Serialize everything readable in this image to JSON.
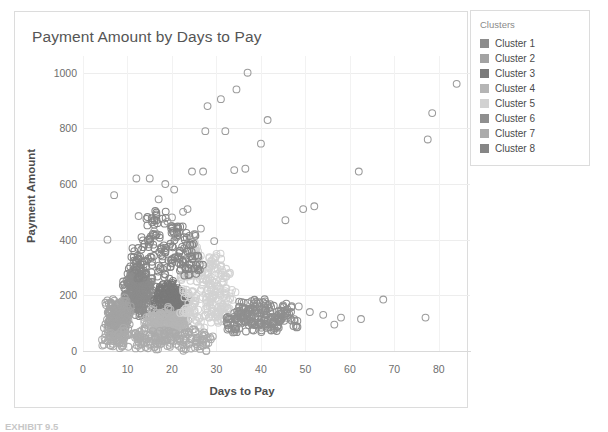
{
  "chart_card": {
    "title": "Payment Amount by Days to Pay"
  },
  "legend": {
    "title": "Clusters",
    "items": [
      {
        "label": "Cluster 1",
        "color": "#8c8c8c"
      },
      {
        "label": "Cluster 2",
        "color": "#a3a3a3"
      },
      {
        "label": "Cluster 3",
        "color": "#7a7a7a"
      },
      {
        "label": "Cluster 4",
        "color": "#b5b5b5"
      },
      {
        "label": "Cluster 5",
        "color": "#d2d2d2"
      },
      {
        "label": "Cluster 6",
        "color": "#8f8f8f"
      },
      {
        "label": "Cluster 7",
        "color": "#ababab"
      },
      {
        "label": "Cluster 8",
        "color": "#868686"
      }
    ]
  },
  "footer": {
    "caption": "EXHIBIT 9.5"
  },
  "chart_data": {
    "type": "scatter",
    "title": "Payment Amount by Days to Pay",
    "xlabel": "Days to Pay",
    "ylabel": "Payment Amount",
    "xlim": [
      0,
      87
    ],
    "ylim": [
      0,
      1060
    ],
    "xticks": [
      0,
      10,
      20,
      30,
      40,
      50,
      60,
      70,
      80
    ],
    "yticks": [
      0,
      200,
      400,
      600,
      800,
      1000
    ],
    "grid": true,
    "legend_position": "right-outside",
    "marker": "open-circle",
    "marker_radius": 3.4,
    "series": [
      {
        "name": "Cluster 1",
        "color": "#8c8c8c",
        "points": [
          [
            9.8,
            148
          ],
          [
            10.6,
            162
          ],
          [
            11.4,
            175
          ],
          [
            12.1,
            190
          ],
          [
            12.9,
            205
          ],
          [
            13.6,
            218
          ],
          [
            14.3,
            231
          ],
          [
            11.0,
            202
          ],
          [
            12.4,
            166
          ],
          [
            13.1,
            245
          ],
          [
            10.2,
            228
          ],
          [
            14.9,
            198
          ],
          [
            11.8,
            255
          ],
          [
            12.7,
            140
          ],
          [
            13.9,
            152
          ],
          [
            10.9,
            270
          ],
          [
            14.1,
            262
          ],
          [
            12.2,
            282
          ],
          [
            11.3,
            238
          ],
          [
            13.4,
            210
          ],
          [
            9.4,
            180
          ],
          [
            15.2,
            240
          ],
          [
            14.6,
            172
          ],
          [
            10.4,
            250
          ],
          [
            12.8,
            225
          ],
          [
            11.6,
            195
          ],
          [
            13.2,
            186
          ],
          [
            9.9,
            215
          ],
          [
            14.4,
            220
          ],
          [
            12.0,
            248
          ]
        ]
      },
      {
        "name": "Cluster 2",
        "color": "#a3a3a3",
        "points": [
          [
            6.2,
            90
          ],
          [
            6.9,
            110
          ],
          [
            7.5,
            128
          ],
          [
            8.1,
            145
          ],
          [
            8.8,
            98
          ],
          [
            7.2,
            165
          ],
          [
            6.5,
            136
          ],
          [
            9.1,
            120
          ],
          [
            8.4,
            82
          ],
          [
            7.8,
            108
          ],
          [
            6.0,
            70
          ],
          [
            9.6,
            140
          ],
          [
            7.0,
            152
          ],
          [
            8.6,
            158
          ],
          [
            6.7,
            118
          ],
          [
            9.3,
            102
          ],
          [
            7.6,
            76
          ],
          [
            8.2,
            132
          ],
          [
            6.3,
            160
          ],
          [
            9.0,
            88
          ],
          [
            7.4,
            95
          ],
          [
            8.9,
            170
          ],
          [
            6.8,
            124
          ],
          [
            9.8,
            114
          ]
        ]
      },
      {
        "name": "Cluster 3",
        "color": "#7a7a7a",
        "points": [
          [
            17.5,
            150
          ],
          [
            18.3,
            168
          ],
          [
            19.1,
            182
          ],
          [
            19.9,
            196
          ],
          [
            20.6,
            210
          ],
          [
            21.4,
            162
          ],
          [
            18.8,
            140
          ],
          [
            20.1,
            175
          ],
          [
            21.9,
            190
          ],
          [
            17.9,
            205
          ],
          [
            19.5,
            128
          ],
          [
            22.4,
            158
          ],
          [
            18.1,
            220
          ],
          [
            20.9,
            146
          ],
          [
            21.1,
            202
          ],
          [
            19.2,
            230
          ],
          [
            22.0,
            172
          ],
          [
            17.2,
            186
          ],
          [
            20.3,
            238
          ],
          [
            21.6,
            134
          ],
          [
            18.6,
            212
          ],
          [
            19.7,
            154
          ],
          [
            22.7,
            180
          ],
          [
            20.5,
            196
          ]
        ]
      },
      {
        "name": "Cluster 4",
        "color": "#b5b5b5",
        "points": [
          [
            15.0,
            90
          ],
          [
            16.2,
            104
          ],
          [
            17.1,
            118
          ],
          [
            18.0,
            78
          ],
          [
            19.0,
            96
          ],
          [
            20.2,
            112
          ],
          [
            21.0,
            86
          ],
          [
            22.1,
            100
          ],
          [
            16.8,
            66
          ],
          [
            18.6,
            126
          ],
          [
            20.8,
            70
          ],
          [
            15.6,
            132
          ],
          [
            17.6,
            58
          ],
          [
            19.4,
            108
          ],
          [
            21.5,
            122
          ],
          [
            16.0,
            116
          ],
          [
            22.6,
            94
          ],
          [
            18.2,
            62
          ],
          [
            20.0,
            138
          ],
          [
            17.3,
            84
          ],
          [
            21.8,
            110
          ],
          [
            19.8,
            74
          ],
          [
            15.3,
            102
          ],
          [
            22.2,
            130
          ]
        ]
      },
      {
        "name": "Cluster 5",
        "color": "#d2d2d2",
        "points": [
          [
            24.0,
            160
          ],
          [
            25.5,
            200
          ],
          [
            26.8,
            240
          ],
          [
            28.1,
            185
          ],
          [
            29.4,
            225
          ],
          [
            30.6,
            150
          ],
          [
            31.8,
            265
          ],
          [
            27.2,
            300
          ],
          [
            25.0,
            275
          ],
          [
            28.9,
            320
          ],
          [
            23.6,
            210
          ],
          [
            30.0,
            195
          ],
          [
            26.0,
            345
          ],
          [
            29.0,
            120
          ],
          [
            31.0,
            230
          ],
          [
            24.8,
            130
          ],
          [
            27.9,
            255
          ],
          [
            32.4,
            175
          ],
          [
            25.8,
            365
          ],
          [
            28.4,
            140
          ],
          [
            30.9,
            290
          ],
          [
            23.2,
            250
          ],
          [
            26.4,
            105
          ],
          [
            29.8,
            330
          ],
          [
            24.4,
            380
          ],
          [
            31.4,
            115
          ],
          [
            27.5,
            170
          ],
          [
            33.0,
            205
          ],
          [
            22.8,
            155
          ],
          [
            32.0,
            145
          ]
        ]
      },
      {
        "name": "Cluster 6",
        "color": "#8f8f8f",
        "points": [
          [
            33.5,
            100
          ],
          [
            35.0,
            130
          ],
          [
            36.5,
            115
          ],
          [
            38.0,
            145
          ],
          [
            39.5,
            90
          ],
          [
            41.0,
            125
          ],
          [
            42.5,
            110
          ],
          [
            44.0,
            140
          ],
          [
            36.0,
            165
          ],
          [
            40.0,
            155
          ],
          [
            43.2,
            95
          ],
          [
            34.6,
            85
          ],
          [
            37.4,
            135
          ],
          [
            45.2,
            120
          ],
          [
            38.8,
            175
          ],
          [
            42.0,
            80
          ],
          [
            35.6,
            105
          ],
          [
            46.0,
            150
          ],
          [
            39.0,
            112
          ],
          [
            44.8,
            132
          ],
          [
            37.0,
            92
          ],
          [
            41.8,
            168
          ],
          [
            34.0,
            122
          ],
          [
            47.0,
            104
          ]
        ]
      },
      {
        "name": "Cluster 7",
        "color": "#ababab",
        "points": [
          [
            5.0,
            40
          ],
          [
            6.0,
            55
          ],
          [
            7.0,
            30
          ],
          [
            8.0,
            48
          ],
          [
            9.0,
            62
          ],
          [
            10.0,
            35
          ],
          [
            11.0,
            50
          ],
          [
            12.0,
            28
          ],
          [
            13.0,
            44
          ],
          [
            14.0,
            58
          ],
          [
            15.0,
            33
          ],
          [
            16.0,
            52
          ],
          [
            17.0,
            26
          ],
          [
            18.0,
            46
          ],
          [
            19.0,
            60
          ],
          [
            20.0,
            38
          ],
          [
            21.0,
            54
          ],
          [
            22.0,
            24
          ],
          [
            23.0,
            42
          ],
          [
            24.0,
            56
          ],
          [
            25.0,
            32
          ],
          [
            26.0,
            48
          ],
          [
            27.0,
            22
          ],
          [
            28.0,
            40
          ]
        ]
      },
      {
        "name": "Cluster 8",
        "color": "#868686",
        "points": [
          [
            13.0,
            300
          ],
          [
            15.0,
            330
          ],
          [
            17.0,
            360
          ],
          [
            19.0,
            310
          ],
          [
            21.0,
            345
          ],
          [
            23.0,
            290
          ],
          [
            14.0,
            395
          ],
          [
            16.0,
            420
          ],
          [
            18.0,
            285
          ],
          [
            20.0,
            440
          ],
          [
            22.0,
            315
          ],
          [
            12.0,
            350
          ],
          [
            24.0,
            405
          ],
          [
            15.5,
            460
          ],
          [
            19.5,
            375
          ],
          [
            25.0,
            325
          ],
          [
            11.5,
            318
          ],
          [
            21.5,
            430
          ],
          [
            17.5,
            480
          ],
          [
            13.5,
            280
          ],
          [
            23.5,
            370
          ],
          [
            26.0,
            295
          ]
        ]
      }
    ],
    "outliers": {
      "name": "High-value outliers",
      "color": "#9b9b9b",
      "points": [
        [
          37.0,
          1000
        ],
        [
          34.5,
          940
        ],
        [
          31.0,
          905
        ],
        [
          28.0,
          880
        ],
        [
          41.5,
          830
        ],
        [
          32.0,
          790
        ],
        [
          84.0,
          960
        ],
        [
          78.5,
          855
        ],
        [
          77.5,
          760
        ],
        [
          27.5,
          790
        ],
        [
          40.0,
          745
        ],
        [
          34.0,
          650
        ],
        [
          36.5,
          655
        ],
        [
          27.0,
          645
        ],
        [
          24.5,
          645
        ],
        [
          62.0,
          645
        ],
        [
          12.0,
          620
        ],
        [
          15.0,
          620
        ],
        [
          18.5,
          600
        ],
        [
          20.5,
          580
        ],
        [
          7.0,
          560
        ],
        [
          17.0,
          545
        ],
        [
          49.5,
          510
        ],
        [
          52.0,
          520
        ],
        [
          45.5,
          470
        ],
        [
          22.5,
          500
        ],
        [
          23.5,
          510
        ],
        [
          20.0,
          480
        ],
        [
          19.0,
          465
        ],
        [
          5.5,
          400
        ],
        [
          26.5,
          440
        ],
        [
          25.0,
          420
        ],
        [
          29.5,
          395
        ],
        [
          12.5,
          485
        ],
        [
          16.0,
          430
        ],
        [
          21.0,
          410
        ],
        [
          67.5,
          185
        ],
        [
          62.5,
          115
        ],
        [
          77.0,
          120
        ],
        [
          56.5,
          95
        ],
        [
          58.0,
          120
        ],
        [
          54.0,
          130
        ],
        [
          51.0,
          140
        ],
        [
          48.5,
          160
        ]
      ]
    }
  }
}
